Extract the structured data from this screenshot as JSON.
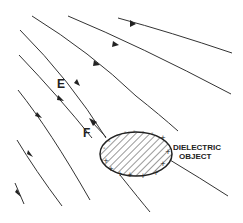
{
  "diagram": {
    "labels": {
      "field": "E",
      "force": "F",
      "object_line1": "DIELECTRIC",
      "object_line2": "OBJECT"
    },
    "object": {
      "fill": "hatched",
      "charges_upper_left": "-",
      "charges_lower_right": "+"
    },
    "colors": {
      "line": "#333333",
      "background": "#ffffff"
    }
  }
}
